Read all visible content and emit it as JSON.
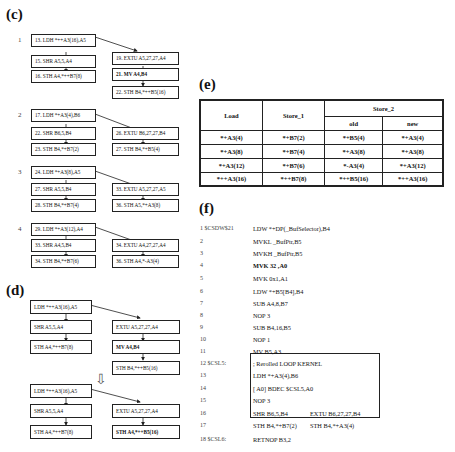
{
  "panel_c": {
    "label": "(c)",
    "groups": [
      {
        "num": "1",
        "left": [
          "13. LDH *++A3(16),A5",
          "15. SHR  A5,5,A4",
          "16. STH  A4,*++B7(8)"
        ],
        "right": [
          "19. EXTU  A5,27,27,A4",
          "21.  MV  A4,B4",
          "22. STH B4,*++B5(16)"
        ]
      },
      {
        "num": "2",
        "left": [
          "17. LDH  *+A3(4),B6",
          "22. SHR  B6,5,B4",
          "23. STH  B4,*+B7(2)"
        ],
        "right": [
          "26. EXTU  B6,27,27,B4",
          "27. STH B4,*+B5(4)"
        ]
      },
      {
        "num": "3",
        "left": [
          "24. LDH  *+A3(8),A5",
          "27. SHR  A5,5,B4",
          "28. STH  B4,*+B7(4)"
        ],
        "right": [
          "33. EXTU  A5,27,27,A5",
          "36. STH A5,*+A3(8)"
        ]
      },
      {
        "num": "4",
        "left": [
          "29. LDH  *+A3(12),A4",
          "33. SHR  A4,5,B4",
          "34. STH  B4,*+B7(6)"
        ],
        "right": [
          "34. EXTU  A4,27,27,A4",
          "36. STH  A4,*-A3(4)"
        ]
      }
    ]
  },
  "panel_d": {
    "label": "(d)",
    "before": {
      "left": [
        "LDH *++A3(16),A5",
        "SHR  A5,5,A4",
        "STH  A4,*++B7(8)"
      ],
      "right": [
        "EXTU  A5,27,27,A4",
        "MV  A4,B4",
        "STH  B4,*++B5(16)"
      ]
    },
    "after": {
      "left": [
        "LDH *++A3(16),A5",
        "SHR  A5,5,A4",
        "STH  A4,*++B7(8)"
      ],
      "right": [
        "EXTU  A5,27,27,A4",
        "STH  A4,*++B5(16)"
      ]
    },
    "transform_arrow": "⇩"
  },
  "panel_e": {
    "label": "(e)",
    "headers": {
      "load": "Load",
      "store1": "Store_1",
      "store2": "Store_2",
      "old": "old",
      "new": "new"
    },
    "rows": [
      [
        "*+A3(4)",
        "*+B7(2)",
        "*+B5(4)",
        "*+A3(4)"
      ],
      [
        "*+A3(8)",
        "*+B7(4)",
        "*+A3(8)",
        "*+A3(8)"
      ],
      [
        "*+A3(12)",
        "*+B7(6)",
        "*-A3(4)",
        "*+A3(12)"
      ],
      [
        "*++A3(16)",
        "*++B7(8)",
        "*++B5(16)",
        "*++A3(16)"
      ]
    ]
  },
  "panel_f": {
    "label": "(f)",
    "lines": [
      {
        "num": "1 $CSDW$21",
        "instr": "LDW   *+DP(_BufSelector),B4",
        "bold": false
      },
      {
        "num": "2",
        "instr": "MVKL   _BufPtr,B5",
        "bold": false
      },
      {
        "num": "3",
        "instr": "MVKH   _BufPtr,B5",
        "bold": false
      },
      {
        "num": "4",
        "instr": "MVK   32 ,A0",
        "bold": true
      },
      {
        "num": "5",
        "instr": "MVK     0x1,A1",
        "bold": false
      },
      {
        "num": "6",
        "instr": "LDW  *+B5[B4],B4",
        "bold": false
      },
      {
        "num": "7",
        "instr": "SUB  A4,8,B7",
        "bold": false
      },
      {
        "num": "8",
        "instr": "NOP      3",
        "bold": false
      },
      {
        "num": "9",
        "instr": "SUB  B4,16,B5",
        "bold": false
      },
      {
        "num": "10",
        "instr": "NOP      1",
        "bold": false
      },
      {
        "num": "11",
        "instr": "MV   B5,A3",
        "bold": false
      },
      {
        "num": "12 $CSL5:",
        "instr": "; Rerolled LOOP KERNEL",
        "bold": false
      },
      {
        "num": "13",
        "instr": "LDH *+A3(4),B6",
        "bold": false
      },
      {
        "num": "14",
        "instr": "[ A0] BDEC $CSL5,A0",
        "bold": false
      },
      {
        "num": "15",
        "instr": "NOP    3",
        "bold": false
      },
      {
        "num": "16",
        "instr": "SHR  B6,5,B4",
        "instr2": "EXTU B6,27,27,B4",
        "bold": false
      },
      {
        "num": "17",
        "instr": "STH  B4,*+B7(2)",
        "instr2": "STH B4,*+A3(4)",
        "bold": false
      },
      {
        "num": "18 $CSL6:",
        "instr": "RETNOP  B3,2",
        "bold": false
      }
    ]
  }
}
